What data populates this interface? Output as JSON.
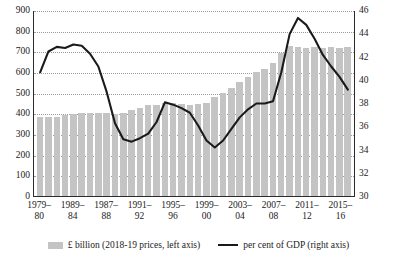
{
  "chart_data": {
    "type": "bar",
    "title": "",
    "subtitle": "",
    "xlabel": "",
    "ylabel": "",
    "grid": true,
    "legend_position": "bottom",
    "categories": [
      "1979–80",
      "1980–81",
      "1981–82",
      "1982–83",
      "1983–84",
      "1984–85",
      "1985–86",
      "1986–87",
      "1987–88",
      "1988–89",
      "1989–90",
      "1990–91",
      "1991–92",
      "1992–93",
      "1993–94",
      "1994–95",
      "1995–96",
      "1996–97",
      "1997–98",
      "1998–99",
      "1999–00",
      "2000–01",
      "2001–02",
      "2002–03",
      "2003–04",
      "2004–05",
      "2005–06",
      "2006–07",
      "2007–08",
      "2008–09",
      "2009–10",
      "2010–11",
      "2011–12",
      "2012–13",
      "2013–14",
      "2014–15",
      "2015–16",
      "2016–17"
    ],
    "series": [
      {
        "name": "£ billion (2018-19 prices, left axis)",
        "type": "bar",
        "axis": "left",
        "color": "#c4c4c4",
        "values": [
          381,
          383,
          384,
          393,
          398,
          404,
          400,
          404,
          404,
          398,
          404,
          414,
          428,
          438,
          441,
          449,
          452,
          444,
          440,
          446,
          452,
          477,
          499,
          525,
          552,
          578,
          601,
          617,
          642,
          690,
          724,
          722,
          716,
          719,
          716,
          722,
          716,
          722
        ]
      },
      {
        "name": "per cent of GDP (right axis)",
        "type": "line",
        "axis": "right",
        "color": "#1a1a1a",
        "values": [
          40.7,
          42.5,
          42.9,
          42.8,
          43.1,
          43.0,
          42.3,
          41.2,
          39.0,
          36.3,
          34.9,
          34.7,
          35.0,
          35.4,
          36.4,
          38.1,
          37.9,
          37.6,
          37.2,
          36.1,
          34.8,
          34.2,
          34.8,
          35.8,
          36.8,
          37.5,
          38.0,
          38.0,
          38.2,
          40.7,
          44.0,
          45.4,
          44.8,
          43.6,
          42.2,
          41.2,
          40.3,
          39.2
        ]
      }
    ],
    "left_axis": {
      "min": 0,
      "max": 900,
      "step": 100,
      "ticks": [
        "0",
        "100",
        "200",
        "300",
        "400",
        "500",
        "600",
        "700",
        "800",
        "900"
      ]
    },
    "right_axis": {
      "min": 30,
      "max": 46,
      "step": 2,
      "ticks": [
        "30",
        "32",
        "34",
        "36",
        "38",
        "40",
        "42",
        "44",
        "46"
      ]
    },
    "x_tick_labels": [
      {
        "index": 0,
        "line1": "1979–",
        "line2": "80"
      },
      {
        "index": 4,
        "line1": "1989–",
        "line2": "84"
      },
      {
        "index": 8,
        "line1": "1987–",
        "line2": "88"
      },
      {
        "index": 12,
        "line1": "1991–",
        "line2": "92"
      },
      {
        "index": 16,
        "line1": "1995–",
        "line2": "96"
      },
      {
        "index": 20,
        "line1": "1999–",
        "line2": "00"
      },
      {
        "index": 24,
        "line1": "2003–",
        "line2": "04"
      },
      {
        "index": 28,
        "line1": "2007–",
        "line2": "08"
      },
      {
        "index": 32,
        "line1": "2011–",
        "line2": "12"
      },
      {
        "index": 36,
        "line1": "2015–",
        "line2": "16"
      }
    ]
  },
  "legend": {
    "items": [
      {
        "label": "£ billion (2018-19 prices, left axis)",
        "marker": "bar-swatch"
      },
      {
        "label": "per cent of GDP (right axis)",
        "marker": "line-swatch"
      }
    ]
  },
  "colors": {
    "bar": "#c4c4c4",
    "line": "#1a1a1a",
    "grid": "#9a9a9a",
    "axis": "#2b2b2b",
    "background": "#ffffff"
  }
}
